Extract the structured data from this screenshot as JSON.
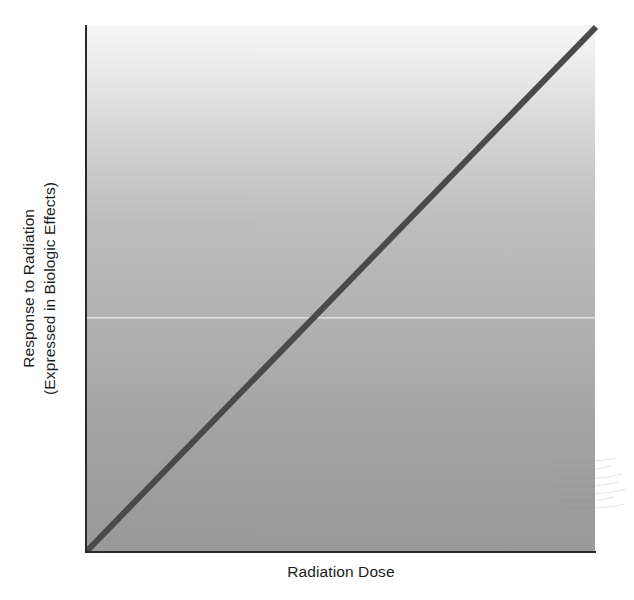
{
  "figure": {
    "background_color": "#ffffff",
    "axis_color": "#2a2a2a",
    "line_color": "#4a4a4a",
    "plot_top_color": "#fafafa",
    "plot_bottom_color": "#9b9b9b"
  },
  "axes": {
    "y_label_line1": "Response to Radiation",
    "y_label_line2": "(Expressed in Biologic Effects)",
    "x_label": "Radiation Dose"
  },
  "chart_data": {
    "type": "line",
    "title": "",
    "subtitle": "",
    "xlabel": "Radiation Dose",
    "ylabel": "Response to Radiation (Expressed in Biologic Effects)",
    "xlim": [
      0,
      1
    ],
    "ylim": [
      0,
      1
    ],
    "grid": false,
    "legend": null,
    "xticks": [],
    "yticks": [],
    "xticklabels": [],
    "yticklabels": [],
    "annotations": [],
    "series": [
      {
        "name": "Linear no-threshold dose-response",
        "color": "#4a4a4a",
        "linewidth": 6,
        "x": [
          0.0,
          0.1,
          0.2,
          0.3,
          0.4,
          0.5,
          0.6,
          0.7,
          0.8,
          0.9,
          1.0
        ],
        "y": [
          0.0,
          0.1,
          0.2,
          0.3,
          0.4,
          0.5,
          0.6,
          0.7,
          0.8,
          0.9,
          1.0
        ]
      }
    ]
  }
}
